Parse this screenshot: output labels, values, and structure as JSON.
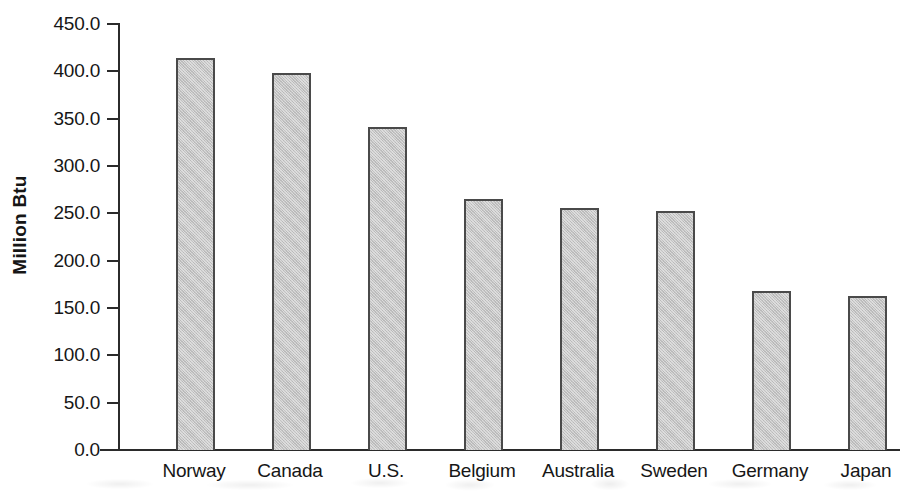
{
  "chart_data": {
    "type": "bar",
    "title": "",
    "xlabel": "",
    "ylabel": "Million Btu",
    "categories": [
      "Norway",
      "Canada",
      "U.S.",
      "Belgium",
      "Australia",
      "Sweden",
      "Germany",
      "Japan"
    ],
    "values": [
      414.0,
      398.0,
      341.0,
      265.0,
      256.0,
      253.0,
      168.0,
      163.0
    ],
    "ylim": [
      0.0,
      450.0
    ],
    "ytick_step": 50.0,
    "ytick_labels": [
      "450.0",
      "400.0",
      "350.0",
      "300.0",
      "250.0",
      "200.0",
      "150.0",
      "100.0",
      "50.0",
      "0.0"
    ],
    "ytick_values": [
      450.0,
      400.0,
      350.0,
      300.0,
      250.0,
      200.0,
      150.0,
      100.0,
      50.0,
      0.0
    ],
    "grid": false,
    "legend": null,
    "bar_fill_color": "#c3c3c3",
    "bar_border_color": "#4a4a4a",
    "axis_color": "#2b2b2b",
    "background_color": "#ffffff"
  }
}
